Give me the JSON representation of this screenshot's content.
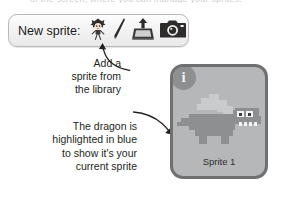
{
  "page": {
    "top_cut_text": "of the screen, where you can manage your sprites."
  },
  "toolbar": {
    "label": "New sprite:",
    "icons": [
      {
        "name": "sprite-library-icon",
        "title": "Choose sprite from library"
      },
      {
        "name": "paint-brush-icon",
        "title": "Paint new sprite"
      },
      {
        "name": "upload-sprite-icon",
        "title": "Upload sprite from file"
      },
      {
        "name": "camera-sprite-icon",
        "title": "New sprite from camera"
      }
    ]
  },
  "callouts": [
    {
      "id": "add-sprite-callout",
      "lines": [
        "Add a",
        "sprite from",
        "the library"
      ]
    },
    {
      "id": "current-sprite-callout",
      "lines": [
        "The dragon is",
        "highlighted in blue",
        "to show it's your",
        "current sprite"
      ]
    }
  ],
  "sprite_panel": {
    "badge": "i",
    "name": "Sprite 1",
    "thumbnail": "dragon-sprite"
  },
  "colors": {
    "panel_border": "#6e7072",
    "panel_fill": "#b6b7b8",
    "badge": "#8d8f90",
    "text": "#231f20",
    "toolbar_border": "#b9b9bc"
  }
}
